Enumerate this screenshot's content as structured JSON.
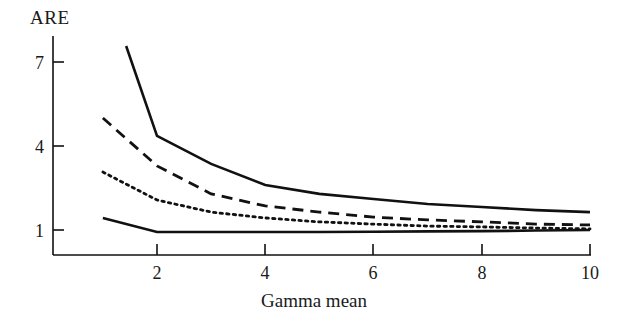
{
  "figure": {
    "background_color": "#ffffff",
    "line_color": "#111111"
  },
  "axes": {
    "ylabel": "ARE",
    "xlabel": "Gamma mean",
    "yticks": [
      "1",
      "4",
      "7"
    ],
    "xticks": [
      "2",
      "4",
      "6",
      "8",
      "10"
    ]
  },
  "chart_data": {
    "type": "line",
    "title": "",
    "xlabel": "Gamma mean",
    "ylabel": "ARE",
    "xlim": [
      1,
      10
    ],
    "ylim": [
      0.7,
      8.2
    ],
    "xticks": [
      2,
      4,
      6,
      8,
      10
    ],
    "yticks": [
      1,
      4,
      7
    ],
    "grid": false,
    "legend": "none",
    "series": [
      {
        "name": "curve-1-solid-upper",
        "style": "solid",
        "x": [
          1.43,
          2.0,
          3.0,
          4.0,
          5.0,
          6.0,
          7.0,
          8.0,
          9.0,
          10.0
        ],
        "y": [
          7.57,
          4.36,
          3.36,
          2.61,
          2.29,
          2.11,
          1.93,
          1.82,
          1.71,
          1.64
        ]
      },
      {
        "name": "curve-2-dashed",
        "style": "dashed",
        "x": [
          1.0,
          2.0,
          3.0,
          4.0,
          5.0,
          6.0,
          7.0,
          8.0,
          9.0,
          10.0
        ],
        "y": [
          5.0,
          3.29,
          2.29,
          1.86,
          1.64,
          1.46,
          1.36,
          1.29,
          1.21,
          1.18
        ]
      },
      {
        "name": "curve-3-dotted",
        "style": "dotted",
        "x": [
          1.0,
          2.0,
          3.0,
          4.0,
          5.0,
          6.0,
          7.0,
          8.0,
          9.0,
          10.0
        ],
        "y": [
          3.07,
          2.07,
          1.64,
          1.43,
          1.29,
          1.21,
          1.14,
          1.11,
          1.07,
          1.04
        ]
      },
      {
        "name": "curve-4-solid-lower",
        "style": "solid",
        "x": [
          1.0,
          2.0,
          3.0,
          4.0,
          5.0,
          6.0,
          7.0,
          8.0,
          9.0,
          10.0
        ],
        "y": [
          1.43,
          0.93,
          0.93,
          0.93,
          0.93,
          0.94,
          0.95,
          0.96,
          0.98,
          1.0
        ]
      }
    ]
  }
}
